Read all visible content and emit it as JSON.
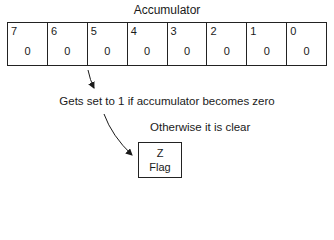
{
  "diagram": {
    "title": "Accumulator",
    "register": {
      "bits": [
        {
          "index": "7",
          "value": "0"
        },
        {
          "index": "6",
          "value": "0"
        },
        {
          "index": "5",
          "value": "0"
        },
        {
          "index": "4",
          "value": "0"
        },
        {
          "index": "3",
          "value": "0"
        },
        {
          "index": "2",
          "value": "0"
        },
        {
          "index": "1",
          "value": "0"
        },
        {
          "index": "0",
          "value": "0"
        }
      ]
    },
    "caption_set": "Gets set to 1 if accumulator becomes zero",
    "caption_clear": "Otherwise it is clear",
    "flag": {
      "line1": "Z",
      "line2": "Flag"
    },
    "colors": {
      "ink": "#1a1a1a",
      "background": "#ffffff"
    }
  }
}
